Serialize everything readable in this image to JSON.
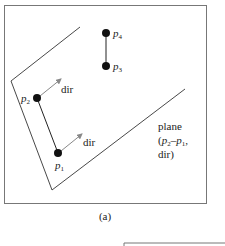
{
  "figure": {
    "caption": "(a)",
    "points": [
      {
        "name": "p",
        "sub": "4"
      },
      {
        "name": "p",
        "sub": "3"
      },
      {
        "name": "p",
        "sub": "2"
      },
      {
        "name": "p",
        "sub": "1"
      }
    ],
    "direction_labels": [
      "dir",
      "dir"
    ],
    "plane_label": {
      "line1": "plane",
      "line2_p2": "p",
      "line2_p2_sub": "2",
      "line2_dash": "–",
      "line2_p1": "p",
      "line2_p1_sub": "1",
      "line2_open": "(",
      "line2_comma": ",",
      "line3": "dir)"
    },
    "colors": {
      "line": "#333333",
      "arrow": "#888888",
      "frame": "#777777",
      "point": "#111111"
    }
  }
}
